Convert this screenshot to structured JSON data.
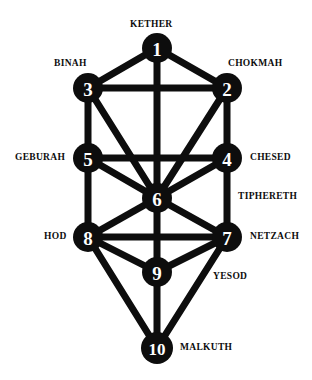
{
  "diagram": {
    "background_color": "#ffffff",
    "node_color": "#0d0d0d",
    "node_number_color": "#ffffff",
    "edge_color": "#0d0d0d",
    "label_color": "#0d0d0d"
  },
  "nodes": [
    {
      "number": "1",
      "label": "KETHER",
      "cx": 157,
      "cy": 48,
      "r": 15,
      "label_x": 130,
      "label_y": 20,
      "label_align": "left"
    },
    {
      "number": "2",
      "label": "CHOKMAH",
      "cx": 227,
      "cy": 88,
      "r": 15,
      "label_x": 228,
      "label_y": 59,
      "label_align": "left"
    },
    {
      "number": "3",
      "label": "BINAH",
      "cx": 88,
      "cy": 88,
      "r": 15,
      "label_x": 54,
      "label_y": 59,
      "label_align": "left"
    },
    {
      "number": "4",
      "label": "CHESED",
      "cx": 227,
      "cy": 158,
      "r": 15,
      "label_x": 250,
      "label_y": 153,
      "label_align": "left"
    },
    {
      "number": "5",
      "label": "GEBURAH",
      "cx": 88,
      "cy": 158,
      "r": 15,
      "label_x": 15,
      "label_y": 153,
      "label_align": "left"
    },
    {
      "number": "6",
      "label": "TIPHERETH",
      "cx": 157,
      "cy": 198,
      "r": 15,
      "label_x": 238,
      "label_y": 192,
      "label_align": "left"
    },
    {
      "number": "7",
      "label": "NETZACH",
      "cx": 227,
      "cy": 237,
      "r": 15,
      "label_x": 250,
      "label_y": 232,
      "label_align": "left"
    },
    {
      "number": "8",
      "label": "HOD",
      "cx": 88,
      "cy": 237,
      "r": 15,
      "label_x": 44,
      "label_y": 232,
      "label_align": "left"
    },
    {
      "number": "9",
      "label": "YESOD",
      "cx": 157,
      "cy": 272,
      "r": 15,
      "label_x": 213,
      "label_y": 272,
      "label_align": "left"
    },
    {
      "number": "10",
      "label": "MALKUTH",
      "cx": 157,
      "cy": 348,
      "r": 16,
      "label_x": 180,
      "label_y": 343,
      "label_align": "left"
    }
  ],
  "edges": [
    {
      "from": "1",
      "to": "3",
      "x1": 157,
      "y1": 48,
      "x2": 88,
      "y2": 88
    },
    {
      "from": "1",
      "to": "2",
      "x1": 157,
      "y1": 48,
      "x2": 227,
      "y2": 88
    },
    {
      "from": "1",
      "to": "6",
      "x1": 157,
      "y1": 48,
      "x2": 157,
      "y2": 198
    },
    {
      "from": "3",
      "to": "2",
      "x1": 88,
      "y1": 88,
      "x2": 227,
      "y2": 88
    },
    {
      "from": "3",
      "to": "5",
      "x1": 88,
      "y1": 88,
      "x2": 88,
      "y2": 158
    },
    {
      "from": "3",
      "to": "6",
      "x1": 88,
      "y1": 88,
      "x2": 157,
      "y2": 198
    },
    {
      "from": "2",
      "to": "4",
      "x1": 227,
      "y1": 88,
      "x2": 227,
      "y2": 158
    },
    {
      "from": "2",
      "to": "6",
      "x1": 227,
      "y1": 88,
      "x2": 157,
      "y2": 198
    },
    {
      "from": "5",
      "to": "4",
      "x1": 88,
      "y1": 158,
      "x2": 227,
      "y2": 158
    },
    {
      "from": "5",
      "to": "6",
      "x1": 88,
      "y1": 158,
      "x2": 157,
      "y2": 198
    },
    {
      "from": "5",
      "to": "8",
      "x1": 88,
      "y1": 158,
      "x2": 88,
      "y2": 237
    },
    {
      "from": "4",
      "to": "6",
      "x1": 227,
      "y1": 158,
      "x2": 157,
      "y2": 198
    },
    {
      "from": "4",
      "to": "7",
      "x1": 227,
      "y1": 158,
      "x2": 227,
      "y2": 237
    },
    {
      "from": "6",
      "to": "8",
      "x1": 157,
      "y1": 198,
      "x2": 88,
      "y2": 237
    },
    {
      "from": "6",
      "to": "7",
      "x1": 157,
      "y1": 198,
      "x2": 227,
      "y2": 237
    },
    {
      "from": "6",
      "to": "9",
      "x1": 157,
      "y1": 198,
      "x2": 157,
      "y2": 272
    },
    {
      "from": "8",
      "to": "7",
      "x1": 88,
      "y1": 237,
      "x2": 227,
      "y2": 237
    },
    {
      "from": "8",
      "to": "9",
      "x1": 88,
      "y1": 237,
      "x2": 157,
      "y2": 272
    },
    {
      "from": "8",
      "to": "10",
      "x1": 88,
      "y1": 237,
      "x2": 157,
      "y2": 348
    },
    {
      "from": "7",
      "to": "9",
      "x1": 227,
      "y1": 237,
      "x2": 157,
      "y2": 272
    },
    {
      "from": "7",
      "to": "10",
      "x1": 227,
      "y1": 237,
      "x2": 157,
      "y2": 348
    },
    {
      "from": "9",
      "to": "10",
      "x1": 157,
      "y1": 272,
      "x2": 157,
      "y2": 348
    }
  ]
}
